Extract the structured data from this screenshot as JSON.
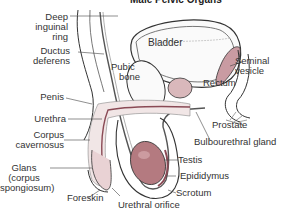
{
  "title": "Male Pelvic Organs",
  "colors": {
    "outline": "#333333",
    "organ_fill": "#d9b8bb",
    "testis_fill": "#b47a80",
    "vesicle_fill": "#c99ba2",
    "erectile_fill": "#f1e6e6",
    "leader": "#444444"
  },
  "labels": {
    "deep_inguinal_ring": [
      "Deep",
      "inguinal",
      "ring"
    ],
    "ductus_deferens": [
      "Ductus",
      "deferens"
    ],
    "bladder": "Bladder",
    "pubic_bone": [
      "Pubic",
      "bone"
    ],
    "seminal_vesicle": [
      "Seminal",
      "vesicle"
    ],
    "rectum": "Rectum",
    "penis": "Penis",
    "urethra": "Urethra",
    "corpus_cavernosus": [
      "Corpus",
      "cavernosus"
    ],
    "prostate": "Prostate",
    "bulbourethral_gland": "Bulbourethral gland",
    "testis": "Testis",
    "epididymus": "Epididymus",
    "glans": [
      "Glans",
      "(corpus",
      "spongiosum)"
    ],
    "scrotum": "Scrotum",
    "foreskin": "Foreskin",
    "urethral_orifice": "Urethral orifice"
  }
}
